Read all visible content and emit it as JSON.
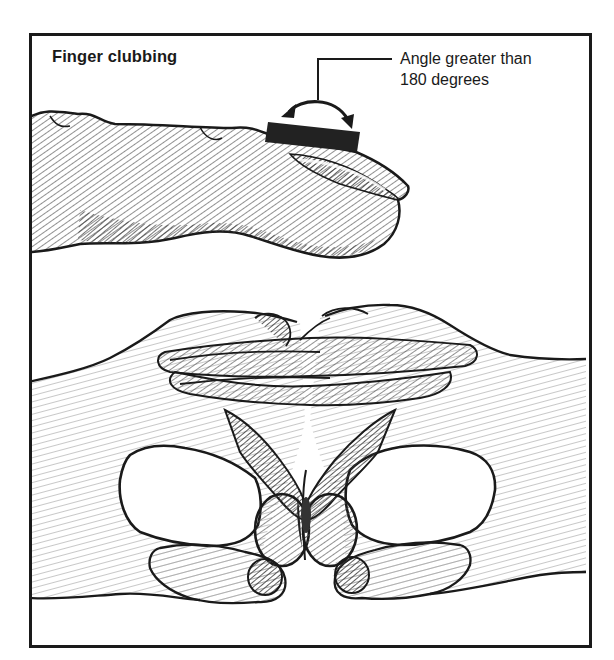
{
  "figure": {
    "title": "Finger clubbing",
    "callout": {
      "line1": "Angle greater than",
      "line2": "180 degrees"
    },
    "illustrations": [
      "clubbed-finger-side-view",
      "schamroth-window-test-hands"
    ],
    "icons": {
      "angle_arrow": "curved-double-arrow-icon",
      "leader_line": "callout-leader-line"
    },
    "colors": {
      "ink": "#1a1a1a",
      "shade_dark": "#3a3a3a",
      "shade_mid": "#8a8a8a",
      "shade_light": "#c8c8c8",
      "paper": "#ffffff"
    }
  }
}
